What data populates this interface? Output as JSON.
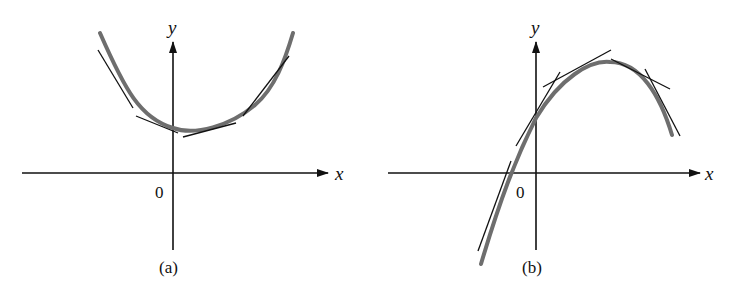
{
  "figure": {
    "panels": [
      {
        "id": "a",
        "caption": "(a)",
        "x_label": "x",
        "y_label": "y",
        "origin_label": "0",
        "description": "Concave-up curve with tangent lines lying below the curve"
      },
      {
        "id": "b",
        "caption": "(b)",
        "x_label": "x",
        "y_label": "y",
        "origin_label": "0",
        "description": "Concave-down curve with tangent lines lying above the curve"
      }
    ],
    "colors": {
      "curve": "#6e6e6e",
      "tangent": "#111111",
      "axis": "#111111"
    }
  }
}
